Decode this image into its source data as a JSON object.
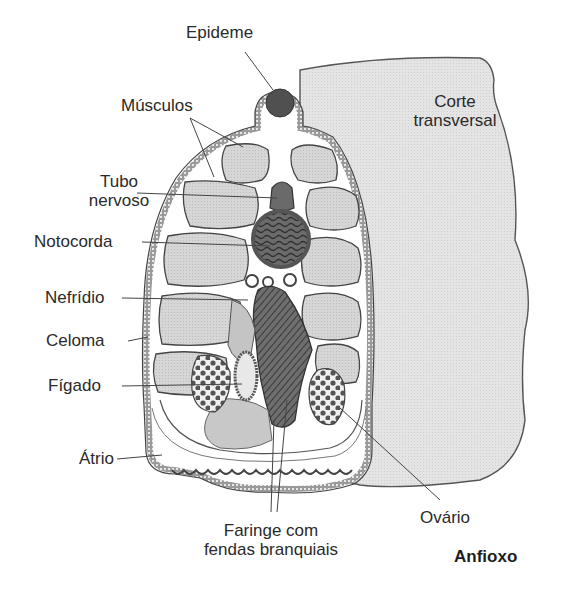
{
  "title": "Anfioxo",
  "section_label": {
    "line1": "Corte",
    "line2": "transversal"
  },
  "labels": {
    "epiderme": "Epideme",
    "musculos": "Músculos",
    "tubo_nervoso": {
      "line1": "Tubo",
      "line2": "nervoso"
    },
    "notocorda": "Notocorda",
    "nefridio": "Nefrídio",
    "celoma": "Celoma",
    "figado": "Fígado",
    "atrio": "Átrio",
    "faringe": {
      "line1": "Faringe com",
      "line2": "fendas branquiais"
    },
    "ovario": "Ovário"
  },
  "colors": {
    "background": "#ffffff",
    "body_fill": "#e6e6e6",
    "muscle_fill": "#d4d4d4",
    "dark_organ": "#555555",
    "outline": "#3a3a3a",
    "text": "#2a2a2a"
  }
}
